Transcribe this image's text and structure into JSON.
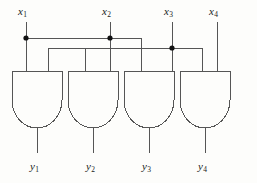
{
  "figure": {
    "type": "logic-circuit-diagram",
    "background": "#fdfdfb",
    "line_color": "#555555",
    "text_color": "#1a1a1a"
  },
  "inputs": [
    {
      "name": "x1",
      "base": "x",
      "sub": "1",
      "x": 26,
      "label_x": 18,
      "label_y": 6
    },
    {
      "name": "x2",
      "base": "x",
      "sub": "2",
      "x": 110,
      "label_x": 102,
      "label_y": 6
    },
    {
      "name": "x3",
      "base": "x",
      "sub": "3",
      "x": 172,
      "label_x": 164,
      "label_y": 6
    },
    {
      "name": "x4",
      "base": "x",
      "sub": "4",
      "x": 217,
      "label_x": 209,
      "label_y": 6
    }
  ],
  "outputs": [
    {
      "name": "y1",
      "base": "y",
      "sub": "1",
      "x": 37,
      "label_x": 30,
      "label_y": 163
    },
    {
      "name": "y2",
      "base": "y",
      "sub": "2",
      "x": 93,
      "label_x": 86,
      "label_y": 163
    },
    {
      "name": "y3",
      "base": "y",
      "sub": "3",
      "x": 149,
      "label_x": 142,
      "label_y": 163
    },
    {
      "name": "y4",
      "base": "y",
      "sub": "4",
      "x": 205,
      "label_x": 198,
      "label_y": 163
    }
  ],
  "gates": [
    {
      "id": "and-gate-1",
      "left": 12,
      "right": 62,
      "top": 71,
      "bottom": 128,
      "inputs": [
        26,
        48
      ]
    },
    {
      "id": "and-gate-2",
      "left": 68,
      "right": 118,
      "top": 71,
      "bottom": 128,
      "inputs": [
        85,
        110
      ]
    },
    {
      "id": "and-gate-3",
      "left": 124,
      "right": 174,
      "top": 71,
      "bottom": 128,
      "inputs": [
        141,
        172
      ]
    },
    {
      "id": "and-gate-4",
      "left": 180,
      "right": 230,
      "top": 71,
      "bottom": 128,
      "inputs": [
        202,
        217
      ]
    }
  ],
  "bus_lines": [
    {
      "id": "bus-x1",
      "y": 38,
      "from_x": 26,
      "to_x": 141
    },
    {
      "id": "bus-x2",
      "y": 38,
      "from_x": 110,
      "to_x": 141
    },
    {
      "id": "bus-x3",
      "y": 48,
      "from_x": 48,
      "to_x": 202
    }
  ],
  "junction_dots": [
    {
      "id": "junction-x1",
      "x": 26,
      "y": 38
    },
    {
      "id": "junction-x2",
      "x": 110,
      "y": 38
    },
    {
      "id": "junction-x3",
      "x": 172,
      "y": 48
    }
  ],
  "wires": {
    "input_stub_top": 22,
    "output_stub_bottom": 152,
    "x1_label_drop_top": 22,
    "note": "x1 drops to bus y=38 then to gate1; branch right to x=141 down into gate3. x2 drops to bus y=38, right branch to 141. x3 bus at y=48 spans 48..202."
  }
}
